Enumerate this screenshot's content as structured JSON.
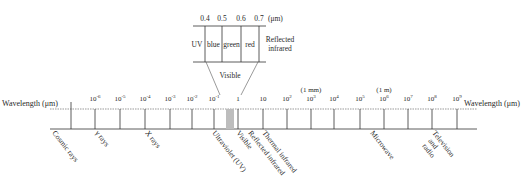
{
  "axis": {
    "title_left": "Wavelength (μm)",
    "title_right": "Wavelength (μm)",
    "ticks": [
      {
        "base": "10",
        "exp": "-6",
        "x": 95
      },
      {
        "base": "10",
        "exp": "-5",
        "x": 120
      },
      {
        "base": "10",
        "exp": "-4",
        "x": 145
      },
      {
        "base": "10",
        "exp": "-3",
        "x": 170
      },
      {
        "base": "10",
        "exp": "-2",
        "x": 192
      },
      {
        "base": "10",
        "exp": "-1",
        "x": 214
      },
      {
        "base": "1",
        "exp": "",
        "x": 238
      },
      {
        "base": "10",
        "exp": "",
        "x": 263
      },
      {
        "base": "10",
        "exp": "2",
        "x": 287
      },
      {
        "base": "10",
        "exp": "3",
        "x": 311
      },
      {
        "base": "10",
        "exp": "4",
        "x": 334
      },
      {
        "base": "10",
        "exp": "5",
        "x": 360
      },
      {
        "base": "10",
        "exp": "6",
        "x": 384
      },
      {
        "base": "10",
        "exp": "7",
        "x": 408
      },
      {
        "base": "10",
        "exp": "8",
        "x": 432
      },
      {
        "base": "10",
        "exp": "9",
        "x": 457
      }
    ],
    "annotations": [
      {
        "label": "(1 mm)",
        "x": 311
      },
      {
        "label": "(1 m)",
        "x": 384
      }
    ]
  },
  "bands": [
    {
      "label": "Cosmic rays",
      "x": 52
    },
    {
      "label": "γ rays",
      "x": 95
    },
    {
      "label": "X rays",
      "x": 145
    },
    {
      "label": "Ultraviolet (UV)",
      "x": 212
    },
    {
      "label": "Visible",
      "x": 236
    },
    {
      "label": "Reflected infrared",
      "x": 248
    },
    {
      "label": "Thermal infrared",
      "x": 262
    },
    {
      "label": "Microwave",
      "x": 370
    },
    {
      "label": "Television",
      "x": 432
    },
    {
      "label": "and",
      "x": 428
    },
    {
      "label": "radio",
      "x": 422
    }
  ],
  "inset": {
    "scale_labels": [
      "0.4",
      "0.5",
      "0.6",
      "0.7"
    ],
    "unit": "(μm)",
    "regions": [
      "UV",
      "blue",
      "green",
      "red"
    ],
    "right_label_line1": "Reflected",
    "right_label_line2": "infrared",
    "caption": "Visible"
  }
}
